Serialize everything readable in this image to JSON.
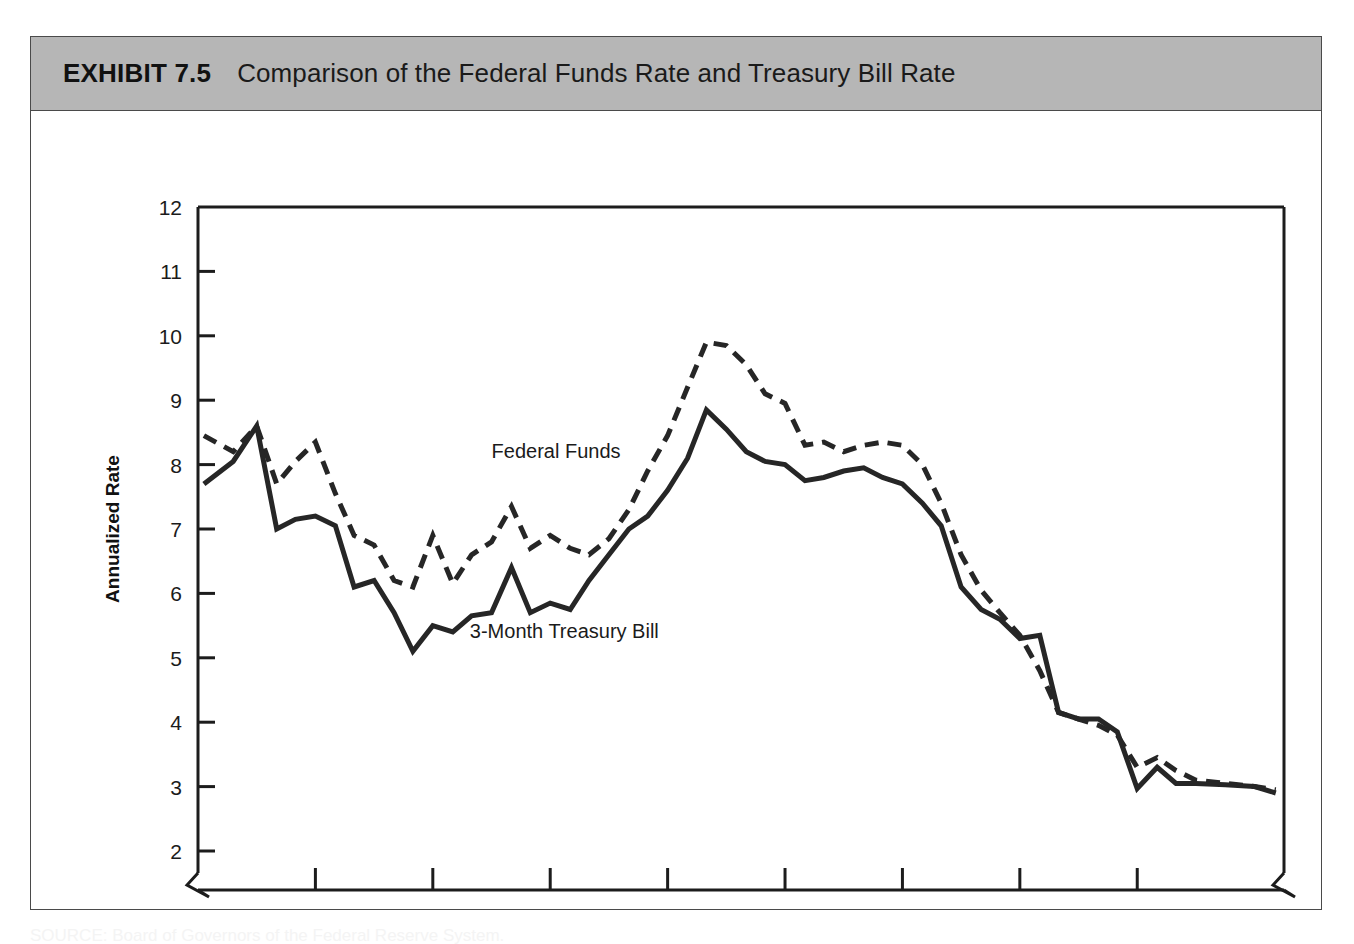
{
  "exhibit": {
    "number_label": "EXHIBIT 7.5",
    "title": "Comparison of the Federal Funds Rate and Treasury Bill Rate",
    "band_color": "#b6b6b6"
  },
  "source_caption": "SOURCE: Board of Governors of the Federal Reserve System.",
  "chart_data": {
    "type": "line",
    "title": "Comparison of the Federal Funds Rate and Treasury Bill Rate",
    "xlabel": "",
    "ylabel": "Annualized Rate",
    "ylim": [
      2,
      12
    ],
    "xlim": [
      1984.5,
      1993.75
    ],
    "y_ticks": [
      2,
      3,
      4,
      5,
      6,
      7,
      8,
      9,
      10,
      11,
      12
    ],
    "x_ticks": [
      1985,
      1986,
      1987,
      1988,
      1989,
      1990,
      1991,
      1992,
      1993
    ],
    "x_tick_labels": [
      "1985",
      "1986",
      "1987",
      "1988",
      "1989",
      "1990",
      "1991",
      "1992",
      "1993"
    ],
    "grid": false,
    "legend_position": "inline-annotation",
    "axis_break_x": true,
    "axis_break_y": true,
    "annotations": [
      {
        "text": "Federal Funds",
        "x": 1987.55,
        "y": 8.1,
        "series": "Federal Funds"
      },
      {
        "text": "3-Month Treasury Bill",
        "x": 1987.62,
        "y": 5.3,
        "series": "3-Month Treasury Bill"
      }
    ],
    "series": [
      {
        "name": "Federal Funds",
        "style": "dashed",
        "color": "#262626",
        "x": [
          1984.55,
          1984.8,
          1985.0,
          1985.17,
          1985.33,
          1985.5,
          1985.67,
          1985.83,
          1986.0,
          1986.17,
          1986.33,
          1986.5,
          1986.67,
          1986.83,
          1987.0,
          1987.17,
          1987.33,
          1987.5,
          1987.67,
          1987.83,
          1988.0,
          1988.17,
          1988.33,
          1988.5,
          1988.67,
          1988.83,
          1989.0,
          1989.17,
          1989.33,
          1989.5,
          1989.67,
          1989.83,
          1990.0,
          1990.17,
          1990.33,
          1990.5,
          1990.67,
          1990.83,
          1991.0,
          1991.17,
          1991.33,
          1991.5,
          1991.67,
          1991.83,
          1992.0,
          1992.17,
          1992.33,
          1992.5,
          1992.67,
          1992.83,
          1993.0,
          1993.25,
          1993.5,
          1993.68
        ],
        "values": [
          8.45,
          8.2,
          8.6,
          7.7,
          8.05,
          8.35,
          7.55,
          6.9,
          6.75,
          6.2,
          6.1,
          6.9,
          6.15,
          6.6,
          6.8,
          7.35,
          6.7,
          6.9,
          6.7,
          6.6,
          6.85,
          7.3,
          7.9,
          8.45,
          9.2,
          9.9,
          9.85,
          9.55,
          9.1,
          8.95,
          8.3,
          8.35,
          8.2,
          8.3,
          8.35,
          8.3,
          8.0,
          7.4,
          6.6,
          6.05,
          5.7,
          5.35,
          4.8,
          4.15,
          4.05,
          3.95,
          3.8,
          3.3,
          3.45,
          3.25,
          3.1,
          3.05,
          3.0,
          2.95
        ]
      },
      {
        "name": "3-Month Treasury Bill",
        "style": "solid",
        "color": "#262626",
        "x": [
          1984.55,
          1984.8,
          1985.0,
          1985.17,
          1985.33,
          1985.5,
          1985.67,
          1985.83,
          1986.0,
          1986.17,
          1986.33,
          1986.5,
          1986.67,
          1986.83,
          1987.0,
          1987.17,
          1987.33,
          1987.5,
          1987.67,
          1987.83,
          1988.0,
          1988.17,
          1988.33,
          1988.5,
          1988.67,
          1988.83,
          1989.0,
          1989.17,
          1989.33,
          1989.5,
          1989.67,
          1989.83,
          1990.0,
          1990.17,
          1990.33,
          1990.5,
          1990.67,
          1990.83,
          1991.0,
          1991.17,
          1991.33,
          1991.5,
          1991.67,
          1991.83,
          1992.0,
          1992.17,
          1992.33,
          1992.5,
          1992.67,
          1992.83,
          1993.0,
          1993.25,
          1993.5,
          1993.68
        ],
        "values": [
          7.7,
          8.05,
          8.6,
          7.0,
          7.15,
          7.2,
          7.05,
          6.1,
          6.2,
          5.7,
          5.1,
          5.5,
          5.4,
          5.65,
          5.7,
          6.4,
          5.7,
          5.85,
          5.75,
          6.2,
          6.6,
          7.0,
          7.2,
          7.6,
          8.1,
          8.85,
          8.55,
          8.2,
          8.05,
          8.0,
          7.75,
          7.8,
          7.9,
          7.95,
          7.8,
          7.7,
          7.4,
          7.05,
          6.1,
          5.75,
          5.6,
          5.3,
          5.35,
          4.15,
          4.05,
          4.05,
          3.85,
          2.97,
          3.3,
          3.05,
          3.05,
          3.03,
          3.0,
          2.9
        ]
      }
    ]
  }
}
